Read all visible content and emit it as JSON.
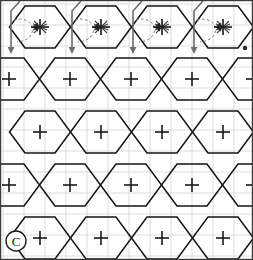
{
  "figure": {
    "width": 253,
    "height": 260,
    "background_color": "#ffffff"
  },
  "frame": {
    "border_color": "#3a3a3a",
    "border_width": 1.2
  },
  "grid": {
    "label": "background square grid",
    "color": "#cfcfcf",
    "line_width": 0.7,
    "spacing": 21,
    "x_origin": 3,
    "y_origin": 4
  },
  "tiling": {
    "label": "hexagon tessellation",
    "stroke_color": "#141414",
    "stroke_width": 1.5,
    "hex_width": 61,
    "hex_half_height": 21,
    "hex_side": 21,
    "column_step": 61,
    "row_step": 63,
    "columns": 4,
    "rows": 4,
    "centers": [
      {
        "row": 1,
        "cx": 40,
        "cy": 27,
        "annotated": true
      },
      {
        "row": 1,
        "cx": 101,
        "cy": 27,
        "annotated": true
      },
      {
        "row": 1,
        "cx": 162,
        "cy": 27,
        "annotated": true
      },
      {
        "row": 1,
        "cx": 223,
        "cy": 27,
        "annotated": true
      },
      {
        "row": 2,
        "cx": 9,
        "cy": 79,
        "annotated": false
      },
      {
        "row": 2,
        "cx": 70,
        "cy": 79,
        "annotated": false
      },
      {
        "row": 2,
        "cx": 131,
        "cy": 79,
        "annotated": false
      },
      {
        "row": 2,
        "cx": 192,
        "cy": 79,
        "annotated": false
      },
      {
        "row": 2,
        "cx": 253,
        "cy": 79,
        "annotated": false
      },
      {
        "row": 3,
        "cx": 40,
        "cy": 132,
        "annotated": false
      },
      {
        "row": 3,
        "cx": 101,
        "cy": 132,
        "annotated": false
      },
      {
        "row": 3,
        "cx": 162,
        "cy": 132,
        "annotated": false
      },
      {
        "row": 3,
        "cx": 223,
        "cy": 132,
        "annotated": false
      },
      {
        "row": 4,
        "cx": 9,
        "cy": 185,
        "annotated": false
      },
      {
        "row": 4,
        "cx": 70,
        "cy": 185,
        "annotated": false
      },
      {
        "row": 4,
        "cx": 131,
        "cy": 185,
        "annotated": false
      },
      {
        "row": 4,
        "cx": 192,
        "cy": 185,
        "annotated": false
      },
      {
        "row": 4,
        "cx": 253,
        "cy": 185,
        "annotated": false
      },
      {
        "row": 5,
        "cx": 40,
        "cy": 238,
        "annotated": false
      },
      {
        "row": 5,
        "cx": 101,
        "cy": 238,
        "annotated": false
      },
      {
        "row": 5,
        "cx": 162,
        "cy": 238,
        "annotated": false
      },
      {
        "row": 5,
        "cx": 223,
        "cy": 238,
        "annotated": false
      }
    ]
  },
  "center_marks": {
    "label": "cross marks at hexagon centers",
    "color": "#1a1a1a",
    "line_width": 1.6,
    "arm_length": 7
  },
  "annotations": {
    "vector_color": "#6e6e6e",
    "vector_width": 1.6,
    "dashed_color": "#7a7a7a",
    "dashed_width": 1.0,
    "dash_pattern": "2.5 2.5",
    "star_color": "#222222",
    "items": [
      {
        "id": 1,
        "cx": 40,
        "cy": 27,
        "down_arrow_x": 11,
        "star": true,
        "curve": true
      },
      {
        "id": 2,
        "cx": 101,
        "cy": 27,
        "down_arrow_x": 72,
        "star": true,
        "curve": true
      },
      {
        "id": 3,
        "cx": 162,
        "cy": 27,
        "down_arrow_x": 133,
        "star": true,
        "curve": true
      },
      {
        "id": 4,
        "cx": 223,
        "cy": 27,
        "down_arrow_x": 194,
        "star": true,
        "curve": true
      }
    ],
    "endpoint_dot": {
      "label": "filled vertex dot",
      "x": 245,
      "y": 48,
      "radius": 2.2,
      "color": "#2a2a2a"
    }
  },
  "copyright_mark": {
    "label": "circled C copyright glyph",
    "text": "C",
    "x": 16,
    "y": 241,
    "radius": 10,
    "color": "#1a1a1a",
    "line_width": 1.4,
    "font_size": 13
  }
}
